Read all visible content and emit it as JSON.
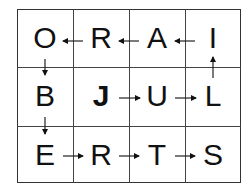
{
  "grid": {
    "rows": 3,
    "cols": 4,
    "cells": [
      [
        {
          "letter": "O",
          "bold": false
        },
        {
          "letter": "R",
          "bold": false
        },
        {
          "letter": "A",
          "bold": false
        },
        {
          "letter": "I",
          "bold": false
        }
      ],
      [
        {
          "letter": "B",
          "bold": false
        },
        {
          "letter": "J",
          "bold": true
        },
        {
          "letter": "U",
          "bold": false
        },
        {
          "letter": "L",
          "bold": false
        }
      ],
      [
        {
          "letter": "E",
          "bold": false
        },
        {
          "letter": "R",
          "bold": false
        },
        {
          "letter": "T",
          "bold": false
        },
        {
          "letter": "S",
          "bold": false
        }
      ]
    ],
    "path_order": [
      "J",
      "U",
      "L",
      "I",
      "A",
      "R",
      "O",
      "B",
      "E",
      "R",
      "T",
      "S"
    ],
    "arrows": [
      {
        "from": [
          1,
          1
        ],
        "to": [
          1,
          2
        ],
        "direction": "right"
      },
      {
        "from": [
          1,
          2
        ],
        "to": [
          1,
          3
        ],
        "direction": "right"
      },
      {
        "from": [
          1,
          3
        ],
        "to": [
          0,
          3
        ],
        "direction": "up"
      },
      {
        "from": [
          0,
          3
        ],
        "to": [
          0,
          2
        ],
        "direction": "left"
      },
      {
        "from": [
          0,
          2
        ],
        "to": [
          0,
          1
        ],
        "direction": "left"
      },
      {
        "from": [
          0,
          1
        ],
        "to": [
          0,
          0
        ],
        "direction": "left"
      },
      {
        "from": [
          0,
          0
        ],
        "to": [
          1,
          0
        ],
        "direction": "down"
      },
      {
        "from": [
          1,
          0
        ],
        "to": [
          2,
          0
        ],
        "direction": "down"
      },
      {
        "from": [
          2,
          0
        ],
        "to": [
          2,
          1
        ],
        "direction": "right"
      },
      {
        "from": [
          2,
          1
        ],
        "to": [
          2,
          2
        ],
        "direction": "right"
      },
      {
        "from": [
          2,
          2
        ],
        "to": [
          2,
          3
        ],
        "direction": "right"
      }
    ],
    "line_color": "#333333",
    "text_color": "#111111"
  }
}
